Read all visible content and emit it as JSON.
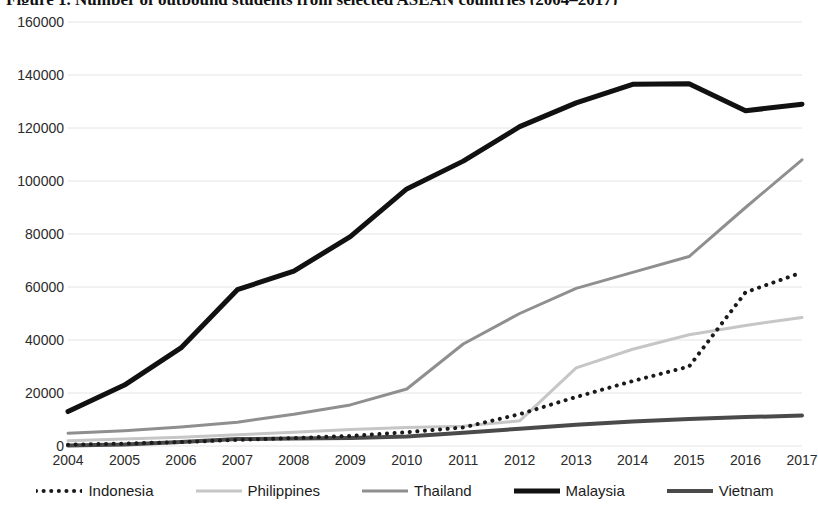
{
  "title": {
    "text": "Figure 1. Number of outbound students from selected ASEAN countries (2004–2017)"
  },
  "chart_data": {
    "type": "line",
    "title": "Figure 1. Number of outbound students from selected ASEAN countries (2004–2017)",
    "xlabel": "",
    "ylabel": "",
    "x": [
      2004,
      2005,
      2006,
      2007,
      2008,
      2009,
      2010,
      2011,
      2012,
      2013,
      2014,
      2015,
      2016,
      2017
    ],
    "categories": [
      "2004",
      "2005",
      "2006",
      "2007",
      "2008",
      "2009",
      "2010",
      "2011",
      "2012",
      "2013",
      "2014",
      "2015",
      "2016",
      "2017"
    ],
    "ylim": [
      0,
      160000
    ],
    "yticks": [
      0,
      20000,
      40000,
      60000,
      80000,
      100000,
      120000,
      140000,
      160000
    ],
    "ytick_labels": [
      "0",
      "20000",
      "40000",
      "60000",
      "80000",
      "100000",
      "120000",
      "140000",
      "160000"
    ],
    "grid": true,
    "legend_position": "bottom",
    "series": [
      {
        "name": "Indonesia",
        "style": "dotted",
        "color": "#1a1a1a",
        "width": 4,
        "values": [
          500,
          900,
          1500,
          2300,
          3000,
          3800,
          5200,
          7000,
          12000,
          18500,
          24500,
          30000,
          58000,
          65500
        ]
      },
      {
        "name": "Philippines",
        "style": "solid",
        "color": "#c6c6c6",
        "width": 3,
        "values": [
          2000,
          2600,
          3300,
          4200,
          5200,
          6200,
          7000,
          7500,
          9500,
          29500,
          36500,
          42000,
          45500,
          48500
        ]
      },
      {
        "name": "Thailand",
        "style": "solid",
        "color": "#8f8f8f",
        "width": 3,
        "values": [
          4800,
          5800,
          7200,
          9000,
          12000,
          15500,
          21500,
          38500,
          50000,
          59500,
          65500,
          71500,
          90000,
          108000
        ]
      },
      {
        "name": "Malaysia",
        "style": "solid",
        "color": "#111111",
        "width": 5,
        "values": [
          13000,
          23000,
          37000,
          59000,
          66000,
          79000,
          97000,
          107500,
          120500,
          129500,
          136500,
          136700,
          126500,
          129000
        ]
      },
      {
        "name": "Vietnam",
        "style": "solid",
        "color": "#4a4a4a",
        "width": 4,
        "values": [
          200,
          600,
          1500,
          2600,
          2800,
          3000,
          3600,
          5000,
          6500,
          8000,
          9200,
          10200,
          10900,
          11500
        ]
      }
    ]
  },
  "legend": {
    "items": [
      {
        "label": "Indonesia",
        "swatch": "dotted-line-swatch"
      },
      {
        "label": "Philippines",
        "swatch": "light-gray-line-swatch"
      },
      {
        "label": "Thailand",
        "swatch": "medium-gray-line-swatch"
      },
      {
        "label": "Malaysia",
        "swatch": "black-line-swatch"
      },
      {
        "label": "Vietnam",
        "swatch": "dark-gray-line-swatch"
      }
    ]
  },
  "axes": {
    "y_labels": [
      "160000",
      "140000",
      "120000",
      "100000",
      "80000",
      "60000",
      "40000",
      "20000",
      "0"
    ],
    "x_labels": [
      "2004",
      "2005",
      "2006",
      "2007",
      "2008",
      "2009",
      "2010",
      "2011",
      "2012",
      "2013",
      "2014",
      "2015",
      "2016",
      "2017"
    ]
  },
  "colors": {
    "grid": "#e4e4ea",
    "axis_text": "#2b2b2b",
    "background": "#ffffff"
  }
}
